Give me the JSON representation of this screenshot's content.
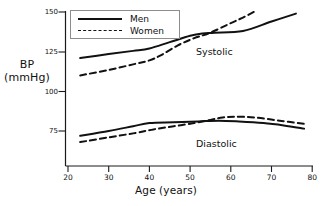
{
  "chart_data": {
    "type": "line",
    "title": "",
    "xlabel": "Age  (years)",
    "ylabel": "BP\n(mmHg)",
    "ylabel_line1": "BP",
    "ylabel_line2": "(mmHg)",
    "xlim": [
      20,
      80
    ],
    "ylim": [
      62,
      153
    ],
    "grid": false,
    "legend_position": "top-left-inside",
    "xticks": [
      20,
      30,
      40,
      50,
      60,
      70,
      80
    ],
    "xtick_labels": [
      "20",
      "30",
      "40",
      "50",
      "60",
      "70",
      "80"
    ],
    "yticks": [
      75,
      100,
      125,
      150
    ],
    "ytick_labels": [
      "75",
      "100",
      "125",
      "150"
    ],
    "legend": [
      {
        "name": "Men",
        "style": "solid"
      },
      {
        "name": "Women",
        "style": "dashed"
      }
    ],
    "annotations": [
      {
        "text": "Systolic",
        "x": 58.5,
        "y": 130.5
      },
      {
        "text": "Diastolic",
        "x": 58.5,
        "y": 72.5
      }
    ],
    "series": [
      {
        "name": "Systolic Men",
        "group": "Systolic",
        "sex": "Men",
        "style": "solid",
        "color": "#111111",
        "x": [
          23,
          30,
          36,
          40,
          45,
          50,
          53,
          56,
          63,
          70,
          76
        ],
        "values": [
          121,
          123.5,
          125.5,
          127,
          131,
          135,
          136.5,
          137,
          138,
          144,
          149
        ]
      },
      {
        "name": "Systolic Women",
        "group": "Systolic",
        "sex": "Women",
        "style": "dashed",
        "color": "#111111",
        "x": [
          23,
          30,
          36,
          40,
          43,
          47,
          51,
          55,
          60,
          63,
          66
        ],
        "values": [
          110,
          113.5,
          117,
          119.5,
          123,
          129,
          133.5,
          137,
          143,
          146.5,
          150.5
        ]
      },
      {
        "name": "Diastolic Men",
        "group": "Diastolic",
        "sex": "Men",
        "style": "solid",
        "color": "#111111",
        "x": [
          23,
          30,
          36,
          40,
          46,
          52,
          57,
          62,
          68,
          73,
          78
        ],
        "values": [
          72,
          75,
          78,
          80,
          80.5,
          81,
          81.5,
          81,
          80,
          78.5,
          76.5
        ]
      },
      {
        "name": "Diastolic Women",
        "group": "Diastolic",
        "sex": "Women",
        "style": "dashed",
        "color": "#111111",
        "x": [
          23,
          30,
          36,
          41,
          46,
          51,
          55,
          58,
          61,
          66,
          72,
          78
        ],
        "values": [
          68,
          71,
          73.5,
          76,
          78,
          80,
          82,
          83.5,
          84,
          83.5,
          81.5,
          79.5
        ]
      }
    ]
  },
  "axes": {
    "y_title_line1": "BP",
    "y_title_line2": "(mmHg)",
    "x_title": "Age  (years)"
  },
  "labels": {
    "systolic": "Systolic",
    "diastolic": "Diastolic"
  },
  "legend": {
    "men": "Men",
    "women": "Women"
  },
  "ticks": {
    "y": [
      "150",
      "125",
      "100",
      "75"
    ],
    "x": [
      "20",
      "30",
      "40",
      "50",
      "60",
      "70",
      "80"
    ]
  },
  "colors": {
    "line": "#111111",
    "axis": "#1a1a1a",
    "legend_border": "#8d8d8d",
    "background": "#ffffff"
  }
}
